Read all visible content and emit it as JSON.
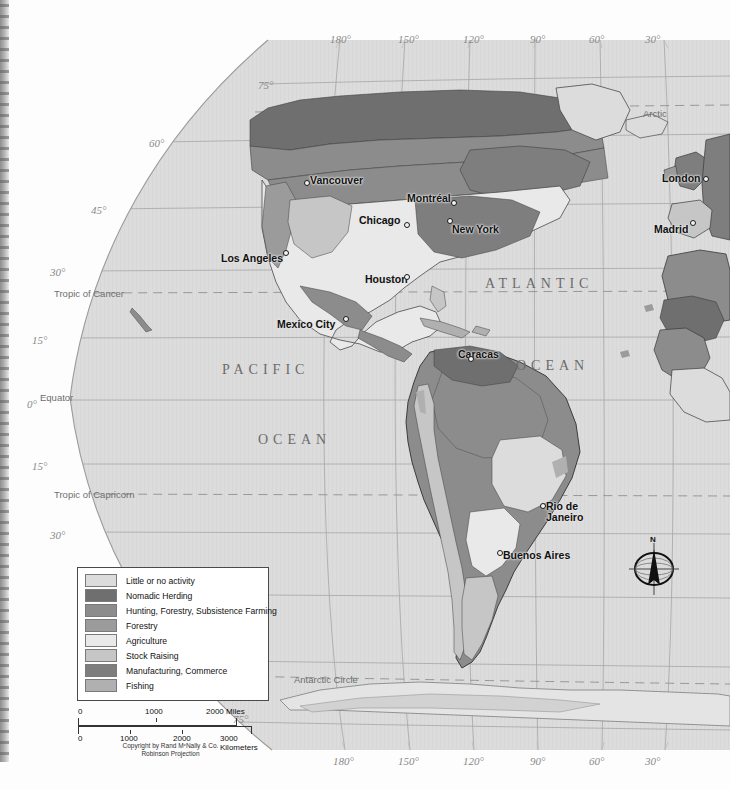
{
  "map": {
    "title": "World Economic Activity — Americas",
    "projection_note": "Robinson Projection",
    "copyright": "Copyright by Rand MᶜNally & Co.",
    "ocean_labels": [
      {
        "text": "PACIFIC",
        "x": 222,
        "y": 362
      },
      {
        "text": "OCEAN",
        "x": 258,
        "y": 432
      },
      {
        "text": "ATLANTIC",
        "x": 485,
        "y": 276
      },
      {
        "text": "OCEAN",
        "x": 516,
        "y": 358
      }
    ],
    "special_lines": [
      {
        "text": "Arctic",
        "x": 643,
        "y": 108
      },
      {
        "text": "Tropic of Cancer",
        "x": 54,
        "y": 288
      },
      {
        "text": "Equator",
        "x": 40,
        "y": 392
      },
      {
        "text": "Tropic of Capricorn",
        "x": 54,
        "y": 489
      },
      {
        "text": "Antarctic Circle",
        "x": 294,
        "y": 674
      }
    ],
    "longitude_labels_top": [
      {
        "text": "180°",
        "x": 330,
        "y": 33
      },
      {
        "text": "150°",
        "x": 398,
        "y": 33
      },
      {
        "text": "120°",
        "x": 463,
        "y": 33
      },
      {
        "text": "90°",
        "x": 530,
        "y": 33
      },
      {
        "text": "60°",
        "x": 589,
        "y": 33
      },
      {
        "text": "30°",
        "x": 645,
        "y": 33
      }
    ],
    "longitude_labels_bottom": [
      {
        "text": "180°",
        "x": 333,
        "y": 755
      },
      {
        "text": "150°",
        "x": 398,
        "y": 755
      },
      {
        "text": "120°",
        "x": 463,
        "y": 755
      },
      {
        "text": "90°",
        "x": 530,
        "y": 755
      },
      {
        "text": "60°",
        "x": 589,
        "y": 755
      },
      {
        "text": "30°",
        "x": 645,
        "y": 755
      }
    ],
    "latitude_labels": [
      {
        "text": "75°",
        "x": 258,
        "y": 79
      },
      {
        "text": "60°",
        "x": 149,
        "y": 137
      },
      {
        "text": "45°",
        "x": 91,
        "y": 204
      },
      {
        "text": "30°",
        "x": 50,
        "y": 266
      },
      {
        "text": "15°",
        "x": 32,
        "y": 334
      },
      {
        "text": "0°",
        "x": 27,
        "y": 398
      },
      {
        "text": "15°",
        "x": 32,
        "y": 460
      },
      {
        "text": "30°",
        "x": 50,
        "y": 529
      },
      {
        "text": "75°",
        "x": 233,
        "y": 713
      }
    ],
    "cities": [
      {
        "name": "Vancouver",
        "label_x": 310,
        "label_y": 174,
        "dot_x": 304,
        "dot_y": 180
      },
      {
        "name": "Montréal",
        "label_x": 407,
        "label_y": 192,
        "dot_x": 451,
        "dot_y": 200
      },
      {
        "name": "Chicago",
        "label_x": 359,
        "label_y": 214,
        "dot_x": 404,
        "dot_y": 222
      },
      {
        "name": "New York",
        "label_x": 452,
        "label_y": 223,
        "dot_x": 447,
        "dot_y": 218
      },
      {
        "name": "Los Angeles",
        "label_x": 221,
        "label_y": 252,
        "dot_x": 283,
        "dot_y": 250
      },
      {
        "name": "Houston",
        "label_x": 365,
        "label_y": 273,
        "dot_x": 404,
        "dot_y": 274
      },
      {
        "name": "Mexico City",
        "label_x": 277,
        "label_y": 318,
        "dot_x": 343,
        "dot_y": 316
      },
      {
        "name": "Caracas",
        "label_x": 458,
        "label_y": 348,
        "dot_x": 468,
        "dot_y": 356
      },
      {
        "name": "Rio de",
        "label_x": 546,
        "label_y": 500,
        "dot_x": 540,
        "dot_y": 503
      },
      {
        "name": "Janeiro",
        "label_x": 546,
        "label_y": 511,
        "dot_x": -1,
        "dot_y": -1
      },
      {
        "name": "Buenos Aires",
        "label_x": 503,
        "label_y": 549,
        "dot_x": 497,
        "dot_y": 550
      },
      {
        "name": "London",
        "label_x": 662,
        "label_y": 172,
        "dot_x": 703,
        "dot_y": 176
      },
      {
        "name": "Madrid",
        "label_x": 654,
        "label_y": 223,
        "dot_x": 690,
        "dot_y": 220
      }
    ],
    "compass": {
      "north_label": "N"
    }
  },
  "legend": {
    "items": [
      {
        "label": "Little or no activity",
        "color": "#dcdcdc"
      },
      {
        "label": "Nomadic Herding",
        "color": "#6f6f6f"
      },
      {
        "label": "Hunting, Forestry, Subsistence Farming",
        "color": "#8c8c8c"
      },
      {
        "label": "Forestry",
        "color": "#9b9b9b"
      },
      {
        "label": "Agriculture",
        "color": "#e9e9e9"
      },
      {
        "label": "Stock Raising",
        "color": "#c6c6c6"
      },
      {
        "label": "Manufacturing, Commerce",
        "color": "#7e7e7e"
      },
      {
        "label": "Fishing",
        "color": "#b0b0b0"
      }
    ]
  },
  "scale": {
    "miles": {
      "ticks": [
        "0",
        "1000",
        "2000 Miles"
      ]
    },
    "kilometers": {
      "ticks": [
        "0",
        "1000",
        "2000",
        "3000 Kilometers"
      ]
    },
    "credit_line1": "Copyright by Rand MᶜNally & Co.",
    "credit_line2": "Robinson Projection"
  },
  "colors": {
    "ocean_fill": "#dcdcdc",
    "graticule": "#9a9a9a",
    "page_background": "#fdfdfd",
    "land_outline": "#3a3a3a"
  }
}
